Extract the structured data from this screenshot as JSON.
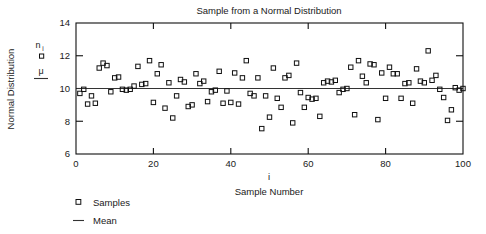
{
  "chart_data": {
    "type": "scatter",
    "title": "Sample from a Normal Distribution",
    "xlabel": "Sample Number",
    "xlabel_symbol": "i",
    "ylabel": "Normal Distribution",
    "xlim": [
      0,
      100
    ],
    "ylim": [
      6,
      14
    ],
    "xticks": [
      0,
      20,
      40,
      60,
      80,
      100
    ],
    "yticks": [
      6,
      8,
      10,
      12,
      14
    ],
    "grid": false,
    "legend_position": "below-left",
    "series": [
      {
        "name": "Samples",
        "marker": "open-square",
        "symbol": "n_i",
        "x": [
          1,
          2,
          3,
          4,
          5,
          6,
          7,
          8,
          9,
          10,
          11,
          12,
          13,
          14,
          15,
          16,
          17,
          18,
          19,
          20,
          21,
          22,
          23,
          24,
          25,
          26,
          27,
          28,
          29,
          30,
          31,
          32,
          33,
          34,
          35,
          36,
          37,
          38,
          39,
          40,
          41,
          42,
          43,
          44,
          45,
          46,
          47,
          48,
          49,
          50,
          51,
          52,
          53,
          54,
          55,
          56,
          57,
          58,
          59,
          60,
          61,
          62,
          63,
          64,
          65,
          66,
          67,
          68,
          69,
          70,
          71,
          72,
          73,
          74,
          75,
          76,
          77,
          78,
          79,
          80,
          81,
          82,
          83,
          84,
          85,
          86,
          87,
          88,
          89,
          90,
          91,
          92,
          93,
          94,
          95,
          96,
          97,
          98,
          99,
          100
        ],
        "y": [
          9.7,
          9.95,
          9.05,
          9.55,
          9.1,
          11.25,
          11.55,
          11.4,
          9.8,
          10.65,
          10.7,
          9.95,
          9.9,
          9.95,
          10.15,
          11.35,
          10.25,
          10.3,
          11.7,
          9.15,
          10.9,
          11.45,
          8.8,
          10.35,
          8.2,
          9.55,
          10.55,
          10.4,
          8.9,
          9.0,
          10.9,
          10.3,
          10.45,
          9.2,
          9.8,
          9.9,
          11.05,
          9.1,
          9.85,
          9.15,
          10.95,
          9.05,
          10.65,
          11.7,
          9.7,
          9.55,
          10.65,
          7.55,
          9.55,
          8.25,
          11.25,
          9.4,
          8.85,
          10.65,
          10.8,
          7.9,
          11.55,
          9.75,
          8.85,
          9.45,
          9.35,
          9.4,
          8.3,
          10.35,
          10.45,
          10.4,
          10.5,
          9.75,
          9.95,
          10.0,
          11.3,
          8.4,
          11.7,
          10.75,
          10.35,
          11.5,
          11.45,
          8.1,
          10.95,
          9.4,
          11.3,
          10.9,
          10.9,
          9.4,
          10.3,
          10.35,
          9.1,
          11.2,
          10.45,
          10.35,
          12.3,
          10.5,
          10.8,
          9.95,
          9.45,
          8.05,
          8.7,
          10.05,
          9.9,
          10.0
        ]
      }
    ],
    "mean_line": {
      "name": "Mean",
      "symbol": "μ",
      "value": 10.0
    }
  },
  "legend": {
    "items": [
      {
        "label": "Samples",
        "marker": "square"
      },
      {
        "label": "Mean",
        "marker": "line"
      }
    ]
  },
  "inline_legend": {
    "sample_symbol": "n",
    "sample_subscript": "i",
    "mean_symbol": "μ"
  },
  "colors": {
    "axis": "#101010",
    "marker": "#101010",
    "mean": "#333333",
    "background": "#ffffff"
  }
}
